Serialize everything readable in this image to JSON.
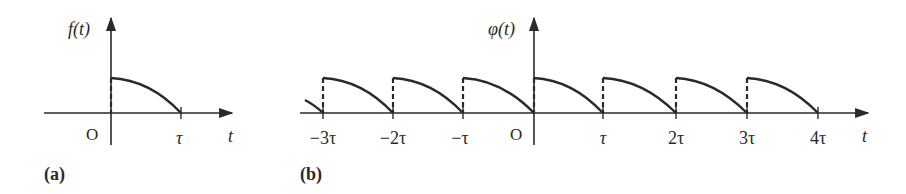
{
  "figure_a": {
    "panel_label": "(a)",
    "y_label": "f(t)",
    "x_label": "t",
    "origin_label": "O",
    "ticks": [
      {
        "label": "τ",
        "value": 1
      }
    ],
    "description": "Single concave-down pulse starting at height h at t=0 and decaying to 0 at t=τ"
  },
  "figure_b": {
    "panel_label": "(b)",
    "y_label": "φ(t)",
    "x_label": "t",
    "origin_label": "O",
    "ticks": [
      {
        "label": "−3τ",
        "value": -3
      },
      {
        "label": "−2τ",
        "value": -2
      },
      {
        "label": "−τ",
        "value": -1
      },
      {
        "label": "τ",
        "value": 1
      },
      {
        "label": "2τ",
        "value": 2
      },
      {
        "label": "3τ",
        "value": 3
      },
      {
        "label": "4τ",
        "value": 4
      }
    ],
    "description": "Periodic extension of f(t) with period τ; dashed vertical jumps at each multiple of τ"
  },
  "colors": {
    "ink": "#2a2a2a",
    "background": "#ffffff"
  }
}
